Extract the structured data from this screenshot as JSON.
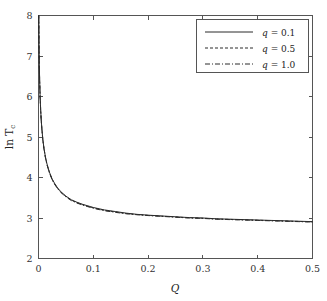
{
  "chart_data": {
    "type": "line",
    "title": "",
    "xlabel": "Q",
    "ylabel": "ln T_c",
    "ylabel_main": "ln T",
    "ylabel_sub": "c",
    "xlim": [
      0,
      0.5
    ],
    "ylim": [
      2,
      8
    ],
    "xticks": [
      0,
      0.1,
      0.2,
      0.3,
      0.4,
      0.5
    ],
    "xtick_labels": [
      "0",
      "0.1",
      "0.2",
      "0.3",
      "0.4",
      "0.5"
    ],
    "yticks": [
      2,
      3,
      4,
      5,
      6,
      7,
      8
    ],
    "ytick_labels": [
      "2",
      "3",
      "4",
      "5",
      "6",
      "7",
      "8"
    ],
    "grid": false,
    "legend_position": "top-right",
    "x": [
      0.0005,
      0.001,
      0.0015,
      0.002,
      0.003,
      0.004,
      0.005,
      0.006,
      0.008,
      0.01,
      0.0125,
      0.015,
      0.0175,
      0.02,
      0.025,
      0.03,
      0.035,
      0.04,
      0.05,
      0.06,
      0.07,
      0.08,
      0.09,
      0.1,
      0.12,
      0.14,
      0.16,
      0.18,
      0.2,
      0.225,
      0.25,
      0.275,
      0.3,
      0.325,
      0.35,
      0.375,
      0.4,
      0.425,
      0.45,
      0.475,
      0.5
    ],
    "series": [
      {
        "name": "q = 0.1",
        "label_var": "q",
        "label_value": "0.1",
        "style": "solid",
        "color": "#2b2b2b",
        "values": [
          8.0,
          7.25,
          6.77,
          6.45,
          5.98,
          5.66,
          5.42,
          5.23,
          4.93,
          4.72,
          4.52,
          4.36,
          4.24,
          4.13,
          3.96,
          3.84,
          3.74,
          3.66,
          3.54,
          3.45,
          3.39,
          3.34,
          3.3,
          3.26,
          3.2,
          3.16,
          3.12,
          3.09,
          3.07,
          3.05,
          3.03,
          3.01,
          3.0,
          2.98,
          2.97,
          2.96,
          2.95,
          2.94,
          2.93,
          2.92,
          2.91
        ]
      },
      {
        "name": "q = 0.5",
        "label_var": "q",
        "label_value": "0.5",
        "style": "dashed",
        "color": "#2b2b2b",
        "values": [
          8.0,
          7.24,
          6.76,
          6.44,
          5.97,
          5.65,
          5.41,
          5.22,
          4.92,
          4.71,
          4.51,
          4.35,
          4.23,
          4.12,
          3.95,
          3.83,
          3.73,
          3.65,
          3.53,
          3.44,
          3.38,
          3.33,
          3.29,
          3.25,
          3.19,
          3.15,
          3.11,
          3.085,
          3.065,
          3.045,
          3.025,
          3.005,
          2.995,
          2.975,
          2.965,
          2.955,
          2.945,
          2.935,
          2.925,
          2.915,
          2.905
        ]
      },
      {
        "name": "q = 1.0",
        "label_var": "q",
        "label_value": "1.0",
        "style": "dashdot",
        "color": "#2b2b2b",
        "values": [
          8.0,
          7.23,
          6.75,
          6.43,
          5.96,
          5.64,
          5.4,
          5.21,
          4.91,
          4.7,
          4.5,
          4.34,
          4.22,
          4.11,
          3.94,
          3.82,
          3.72,
          3.64,
          3.52,
          3.43,
          3.37,
          3.32,
          3.28,
          3.24,
          3.18,
          3.14,
          3.105,
          3.08,
          3.06,
          3.04,
          3.02,
          3.0,
          2.99,
          2.97,
          2.96,
          2.95,
          2.94,
          2.93,
          2.92,
          2.91,
          2.9
        ]
      }
    ]
  }
}
